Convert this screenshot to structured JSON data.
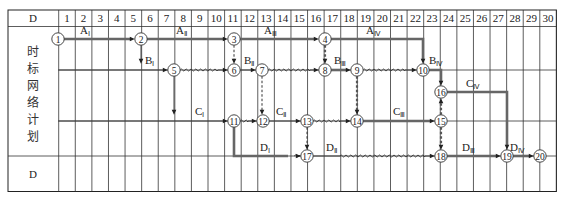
{
  "table": {
    "header_label": "D",
    "footer_label": "D",
    "side_label_chars": [
      "时",
      "标",
      "网",
      "络",
      "计",
      "划"
    ],
    "columns": [
      "1",
      "2",
      "3",
      "4",
      "5",
      "6",
      "7",
      "8",
      "9",
      "10",
      "11",
      "12",
      "13",
      "14",
      "15",
      "16",
      "17",
      "18",
      "19",
      "20",
      "21",
      "22",
      "23",
      "24",
      "25",
      "26",
      "27",
      "28",
      "29",
      "30"
    ],
    "colors": {
      "line": "#333333",
      "critical": "#666666",
      "background": "#ffffff"
    }
  },
  "nodes": [
    {
      "id": "1",
      "x": 58,
      "y": 39
    },
    {
      "id": "2",
      "x": 141,
      "y": 39
    },
    {
      "id": "3",
      "x": 234,
      "y": 39
    },
    {
      "id": "4",
      "x": 325,
      "y": 39
    },
    {
      "id": "5",
      "x": 174,
      "y": 70
    },
    {
      "id": "6",
      "x": 234,
      "y": 70
    },
    {
      "id": "7",
      "x": 262,
      "y": 70
    },
    {
      "id": "8",
      "x": 325,
      "y": 70
    },
    {
      "id": "9",
      "x": 357,
      "y": 70
    },
    {
      "id": "10",
      "x": 423,
      "y": 70
    },
    {
      "id": "16",
      "x": 441,
      "y": 92
    },
    {
      "id": "11",
      "x": 234,
      "y": 121
    },
    {
      "id": "12",
      "x": 263,
      "y": 121
    },
    {
      "id": "13",
      "x": 307,
      "y": 121
    },
    {
      "id": "14",
      "x": 357,
      "y": 121
    },
    {
      "id": "15",
      "x": 441,
      "y": 121
    },
    {
      "id": "17",
      "x": 307,
      "y": 156
    },
    {
      "id": "18",
      "x": 441,
      "y": 156
    },
    {
      "id": "19",
      "x": 507,
      "y": 156
    },
    {
      "id": "20",
      "x": 540,
      "y": 156
    }
  ],
  "activities": [
    {
      "name": "A",
      "sub": "Ⅰ",
      "type": "critical",
      "points": [
        [
          58,
          39
        ],
        [
          141,
          39
        ]
      ],
      "label_at": [
        80,
        34
      ]
    },
    {
      "name": "A",
      "sub": "Ⅱ",
      "type": "critical",
      "points": [
        [
          141,
          39
        ],
        [
          234,
          39
        ]
      ],
      "label_at": [
        176,
        34
      ]
    },
    {
      "name": "A",
      "sub": "Ⅲ",
      "type": "critical",
      "points": [
        [
          234,
          39
        ],
        [
          325,
          39
        ]
      ],
      "label_at": [
        264,
        34
      ]
    },
    {
      "name": "A",
      "sub": "Ⅳ",
      "type": "critical",
      "points": [
        [
          325,
          39
        ],
        [
          423,
          39
        ],
        [
          423,
          70
        ]
      ],
      "label_at": [
        366,
        34
      ]
    },
    {
      "name": "B",
      "sub": "Ⅰ",
      "type": "solid",
      "points": [
        [
          58,
          70
        ],
        [
          174,
          70
        ]
      ],
      "label_at": [
        145,
        64
      ]
    },
    {
      "name": "",
      "sub": "",
      "type": "solid",
      "points": [
        [
          141,
          39
        ],
        [
          141,
          70
        ]
      ],
      "label_at": null
    },
    {
      "name": "",
      "sub": "",
      "type": "wavy-then-solid",
      "points": [
        [
          174,
          70
        ],
        [
          218,
          70
        ],
        [
          234,
          70
        ]
      ],
      "label_at": null
    },
    {
      "name": "B",
      "sub": "Ⅱ",
      "type": "solid",
      "points": [
        [
          234,
          70
        ],
        [
          262,
          70
        ]
      ],
      "label_at": [
        244,
        64
      ]
    },
    {
      "name": "",
      "sub": "",
      "type": "wavy-then-solid",
      "points": [
        [
          262,
          70
        ],
        [
          310,
          70
        ],
        [
          325,
          70
        ]
      ],
      "label_at": null
    },
    {
      "name": "B",
      "sub": "Ⅲ",
      "type": "critical",
      "points": [
        [
          325,
          70
        ],
        [
          357,
          70
        ]
      ],
      "label_at": [
        334,
        64
      ]
    },
    {
      "name": "",
      "sub": "",
      "type": "wavy-then-solid",
      "points": [
        [
          357,
          70
        ],
        [
          405,
          70
        ],
        [
          423,
          70
        ]
      ],
      "label_at": null
    },
    {
      "name": "B",
      "sub": "Ⅳ",
      "type": "critical",
      "points": [
        [
          423,
          70
        ],
        [
          441,
          70
        ],
        [
          441,
          92
        ]
      ],
      "label_at": [
        429,
        64
      ]
    },
    {
      "name": "C",
      "sub": "Ⅰ",
      "type": "solid",
      "points": [
        [
          58,
          121
        ],
        [
          234,
          121
        ]
      ],
      "label_at": [
        195,
        115
      ]
    },
    {
      "name": "",
      "sub": "",
      "type": "solid",
      "points": [
        [
          174,
          70
        ],
        [
          174,
          121
        ]
      ],
      "label_at": null
    },
    {
      "name": "",
      "sub": "",
      "type": "wavy-then-solid",
      "points": [
        [
          234,
          121
        ],
        [
          248,
          121
        ],
        [
          263,
          121
        ]
      ],
      "label_at": null
    },
    {
      "name": "C",
      "sub": "Ⅱ",
      "type": "solid",
      "points": [
        [
          263,
          121
        ],
        [
          307,
          121
        ]
      ],
      "label_at": [
        276,
        115
      ]
    },
    {
      "name": "",
      "sub": "",
      "type": "wavy-then-solid",
      "points": [
        [
          307,
          121
        ],
        [
          340,
          121
        ],
        [
          357,
          121
        ]
      ],
      "label_at": null
    },
    {
      "name": "C",
      "sub": "Ⅲ",
      "type": "critical",
      "points": [
        [
          357,
          121
        ],
        [
          441,
          121
        ]
      ],
      "label_at": [
        393,
        115
      ]
    },
    {
      "name": "C",
      "sub": "Ⅳ",
      "type": "critical",
      "points": [
        [
          441,
          92
        ],
        [
          507,
          92
        ],
        [
          507,
          156
        ]
      ],
      "label_at": [
        466,
        87
      ]
    },
    {
      "name": "",
      "sub": "",
      "type": "critical-nohead",
      "points": [
        [
          234,
          121
        ],
        [
          234,
          156
        ],
        [
          288,
          156
        ]
      ],
      "label_at": null
    },
    {
      "name": "D",
      "sub": "Ⅰ",
      "type": "wavy-then-solid",
      "points": [
        [
          288,
          156
        ],
        [
          300,
          156
        ],
        [
          307,
          156
        ]
      ],
      "label_at": [
        260,
        151
      ]
    },
    {
      "name": "D",
      "sub": "Ⅱ",
      "type": "solid-then-wavy",
      "points": [
        [
          307,
          156
        ],
        [
          340,
          156
        ],
        [
          425,
          156
        ],
        [
          441,
          156
        ]
      ],
      "label_at": [
        326,
        151
      ]
    },
    {
      "name": "D",
      "sub": "Ⅲ",
      "type": "critical",
      "points": [
        [
          441,
          156
        ],
        [
          507,
          156
        ]
      ],
      "label_at": [
        462,
        151
      ]
    },
    {
      "name": "D",
      "sub": "Ⅳ",
      "type": "critical",
      "points": [
        [
          507,
          156
        ],
        [
          540,
          156
        ]
      ],
      "label_at": [
        510,
        151
      ]
    }
  ],
  "dummies": [
    {
      "from": "3",
      "to": "6",
      "critical": false,
      "points": [
        [
          234,
          39
        ],
        [
          234,
          70
        ]
      ]
    },
    {
      "from": "4",
      "to": "8",
      "critical": true,
      "points": [
        [
          325,
          39
        ],
        [
          325,
          70
        ]
      ]
    },
    {
      "from": "7",
      "to": "12",
      "critical": false,
      "points": [
        [
          262,
          70
        ],
        [
          262,
          121
        ]
      ]
    },
    {
      "from": "9",
      "to": "14",
      "critical": true,
      "points": [
        [
          357,
          70
        ],
        [
          357,
          121
        ]
      ]
    },
    {
      "from": "13",
      "to": "17",
      "critical": false,
      "points": [
        [
          307,
          121
        ],
        [
          307,
          156
        ]
      ]
    },
    {
      "from": "15",
      "to": "16",
      "critical": true,
      "points": [
        [
          441,
          121
        ],
        [
          441,
          92
        ]
      ]
    },
    {
      "from": "15",
      "to": "18",
      "critical": true,
      "points": [
        [
          441,
          121
        ],
        [
          441,
          156
        ]
      ]
    }
  ]
}
